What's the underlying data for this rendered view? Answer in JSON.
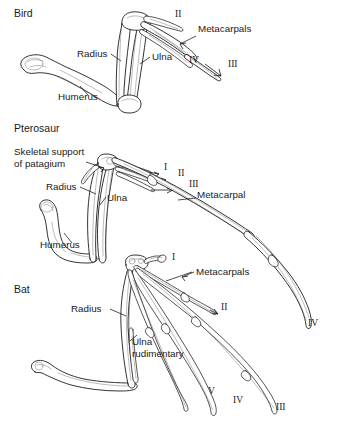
{
  "figure": {
    "background_color": "#ffffff",
    "line_color": "#1c1c1c",
    "text_color": "#1a1a1a",
    "width": 338,
    "height": 424
  },
  "panels": [
    {
      "id": "bird",
      "taxon_label": "Bird",
      "taxon_label_pos": {
        "x": 14,
        "y": 17
      },
      "bone_labels": [
        {
          "key": "radius",
          "text": "Radius",
          "x": 77,
          "y": 57,
          "anchor": "start"
        },
        {
          "key": "ulna",
          "text": "Ulna",
          "x": 152,
          "y": 60,
          "anchor": "start"
        },
        {
          "key": "humerus",
          "text": "Humerus",
          "x": 58,
          "y": 100,
          "anchor": "start"
        },
        {
          "key": "metacarpals",
          "text": "Metacarpals",
          "x": 198,
          "y": 32,
          "anchor": "start"
        }
      ],
      "digit_labels": [
        {
          "text": "II",
          "x": 175,
          "y": 17
        },
        {
          "text": "IV",
          "x": 189,
          "y": 63
        },
        {
          "text": "III",
          "x": 228,
          "y": 67
        }
      ]
    },
    {
      "id": "pterosaur",
      "taxon_label": "Pterosaur",
      "taxon_label_pos": {
        "x": 14,
        "y": 132
      },
      "bone_labels": [
        {
          "key": "patagium_line1",
          "text": "Skeletal support",
          "x": 14,
          "y": 155,
          "anchor": "start"
        },
        {
          "key": "patagium_line2",
          "text": "of patagium",
          "x": 14,
          "y": 167,
          "anchor": "start"
        },
        {
          "key": "radius",
          "text": "Radius",
          "x": 46,
          "y": 190,
          "anchor": "start"
        },
        {
          "key": "ulna",
          "text": "Ulna",
          "x": 107,
          "y": 201,
          "anchor": "start"
        },
        {
          "key": "humerus",
          "text": "Humerus",
          "x": 40,
          "y": 248,
          "anchor": "start"
        },
        {
          "key": "metacarpal",
          "text": "Metacarpal",
          "x": 197,
          "y": 198,
          "anchor": "start"
        }
      ],
      "digit_labels": [
        {
          "text": "I",
          "x": 164,
          "y": 170
        },
        {
          "text": "II",
          "x": 178,
          "y": 176
        },
        {
          "text": "III",
          "x": 189,
          "y": 187
        },
        {
          "text": "IV",
          "x": 308,
          "y": 326
        }
      ]
    },
    {
      "id": "bat",
      "taxon_label": "Bat",
      "taxon_label_pos": {
        "x": 14,
        "y": 293
      },
      "bone_labels": [
        {
          "key": "radius",
          "text": "Radius",
          "x": 71,
          "y": 312,
          "anchor": "start"
        },
        {
          "key": "ulna_line1",
          "text": "Ulna",
          "x": 132,
          "y": 345,
          "anchor": "start"
        },
        {
          "key": "ulna_line2",
          "text": "rudimentary",
          "x": 132,
          "y": 357,
          "anchor": "start"
        },
        {
          "key": "metacarpals",
          "text": "Metacarpals",
          "x": 196,
          "y": 275,
          "anchor": "start"
        }
      ],
      "digit_labels": [
        {
          "text": "I",
          "x": 172,
          "y": 260
        },
        {
          "text": "II",
          "x": 221,
          "y": 310
        },
        {
          "text": "V",
          "x": 208,
          "y": 394
        },
        {
          "text": "IV",
          "x": 233,
          "y": 403
        },
        {
          "text": "III",
          "x": 276,
          "y": 410
        }
      ]
    }
  ]
}
